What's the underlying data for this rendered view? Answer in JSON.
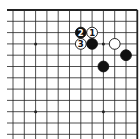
{
  "diagram": {
    "type": "go-board-fragment",
    "corner": "top-right",
    "columns": 12,
    "rows": 12,
    "colors": {
      "background": "#ffffff",
      "line": "#222222",
      "black": "#111111",
      "white": "#ffffff"
    },
    "star_points": [
      [
        2,
        3
      ],
      [
        8,
        3
      ],
      [
        2,
        9
      ],
      [
        8,
        9
      ]
    ],
    "stones": [
      {
        "col": 7,
        "row": 2,
        "color": "white",
        "label": "1"
      },
      {
        "col": 6,
        "row": 2,
        "color": "black",
        "label": "2"
      },
      {
        "col": 6,
        "row": 3,
        "color": "white",
        "label": "3"
      },
      {
        "col": 7,
        "row": 3,
        "color": "black",
        "label": ""
      },
      {
        "col": 9,
        "row": 3,
        "color": "white",
        "label": ""
      },
      {
        "col": 10,
        "row": 4,
        "color": "black",
        "label": ""
      },
      {
        "col": 8,
        "row": 5,
        "color": "black",
        "label": ""
      }
    ]
  }
}
